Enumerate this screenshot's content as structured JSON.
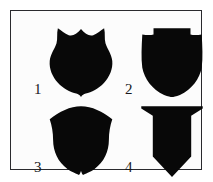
{
  "figure": {
    "background_color": "#ffffff",
    "panel_color": "#fcfcfc",
    "border_color": "#2a2a2e",
    "shape_fill_color": "#080808",
    "label_color": "#18181c",
    "layout": "2x2 grid",
    "item_count": 4
  },
  "shields": [
    {
      "number": "1",
      "name": "scalloped-police-badge-shield",
      "description": "Badge-style shield with scalloped top having a central peak, two dips and flared corner points; curved sides converging to a small bottom nib"
    },
    {
      "number": "2",
      "name": "flat-top-notched-shoulder-shield",
      "description": "Shield with raised flat top section, stepped-down notched shoulders, near-straight sides and a smoothly rounded pointed base"
    },
    {
      "number": "3",
      "name": "arched-top-lobed-base-shield",
      "description": "Shield with broad domed arched top, flared outward corners, gently concave sides and a rounded lobed base with a small central nib"
    },
    {
      "number": "4",
      "name": "flared-cap-angular-point-shield",
      "description": "Angular shield with a wide flared trapezoidal cap, straight vertical sides and a sharp V-shaped point at the bottom"
    }
  ]
}
